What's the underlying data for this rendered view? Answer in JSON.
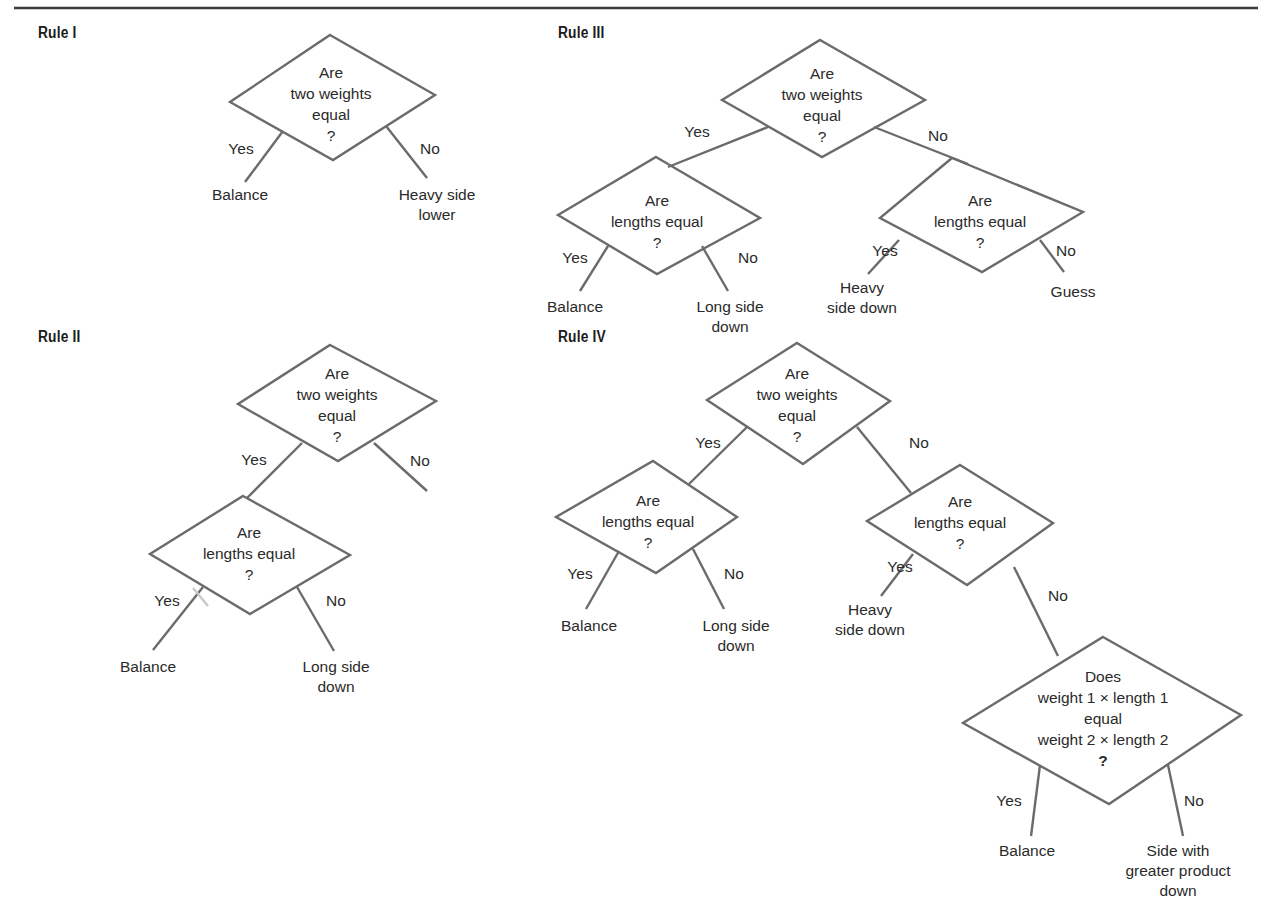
{
  "page": {
    "top_rule": {
      "x1": 14,
      "y1": 8,
      "x2": 1258,
      "y2": 8,
      "color": "#3a3a3a"
    }
  },
  "colors": {
    "line": "#6b6b6b",
    "text": "#2a2a2a",
    "title": "#1c1c1c"
  },
  "rules": [
    {
      "id": "rule-1",
      "title": "Rule I",
      "title_pos": {
        "x": 38,
        "y": 38
      },
      "decisions": [
        {
          "id": "r1-weights",
          "points": [
            [
              330,
              35
            ],
            [
              435,
              95
            ],
            [
              333,
              160
            ],
            [
              230,
              102
            ]
          ],
          "lines": [
            "Are",
            "two weights",
            "equal",
            "?"
          ],
          "text_x": 331,
          "text_y": 78,
          "line_h": 21
        }
      ],
      "edges": [
        {
          "from": "r1-weights",
          "x1": 283,
          "y1": 131,
          "x2": 245,
          "y2": 182,
          "label": "Yes",
          "lx": 241,
          "ly": 154
        },
        {
          "from": "r1-weights",
          "x1": 386,
          "y1": 126,
          "x2": 427,
          "y2": 178,
          "label": "No",
          "lx": 430,
          "ly": 154
        }
      ],
      "outcomes": [
        {
          "lines": [
            "Balance"
          ],
          "x": 240,
          "y": 200
        },
        {
          "lines": [
            "Heavy side",
            "lower"
          ],
          "x": 437,
          "y": 200
        }
      ]
    },
    {
      "id": "rule-3",
      "title": "Rule III",
      "title_pos": {
        "x": 558,
        "y": 38
      },
      "decisions": [
        {
          "id": "r3-weights",
          "points": [
            [
              820,
              40
            ],
            [
              925,
              100
            ],
            [
              822,
              157
            ],
            [
              722,
              100
            ]
          ],
          "lines": [
            "Are",
            "two weights",
            "equal",
            "?"
          ],
          "text_x": 822,
          "text_y": 79,
          "line_h": 21
        },
        {
          "id": "r3-lengths-left",
          "points": [
            [
              656,
              157
            ],
            [
              760,
              218
            ],
            [
              657,
              274
            ],
            [
              558,
              215
            ]
          ],
          "lines": [
            "Are",
            "lengths equal",
            "?"
          ],
          "text_x": 657,
          "text_y": 206,
          "line_h": 21
        },
        {
          "id": "r3-lengths-right",
          "points": [
            [
              952,
              158
            ],
            [
              1083,
              212
            ],
            [
              982,
              272
            ],
            [
              880,
              218
            ]
          ],
          "lines": [
            "Are",
            "lengths equal",
            "?"
          ],
          "text_x": 980,
          "text_y": 206,
          "line_h": 21
        }
      ],
      "edges": [
        {
          "from": "r3-weights",
          "x1": 768,
          "y1": 127,
          "x2": 668,
          "y2": 167,
          "label": "Yes",
          "lx": 697,
          "ly": 137
        },
        {
          "from": "r3-weights",
          "x1": 874,
          "y1": 127,
          "x2": 968,
          "y2": 164,
          "label": "No",
          "lx": 938,
          "ly": 141
        },
        {
          "from": "r3-lengths-left",
          "x1": 608,
          "y1": 246,
          "x2": 580,
          "y2": 291,
          "label": "Yes",
          "lx": 575,
          "ly": 263
        },
        {
          "from": "r3-lengths-left",
          "x1": 702,
          "y1": 246,
          "x2": 728,
          "y2": 291,
          "label": "No",
          "lx": 748,
          "ly": 263
        },
        {
          "from": "r3-lengths-right",
          "x1": 899,
          "y1": 240,
          "x2": 868,
          "y2": 274,
          "label": "Yes",
          "lx": 885,
          "ly": 256
        },
        {
          "from": "r3-lengths-right",
          "x1": 1040,
          "y1": 240,
          "x2": 1064,
          "y2": 272,
          "label": "No",
          "lx": 1066,
          "ly": 256
        }
      ],
      "outcomes": [
        {
          "lines": [
            "Balance"
          ],
          "x": 575,
          "y": 312
        },
        {
          "lines": [
            "Long side",
            "down"
          ],
          "x": 730,
          "y": 312
        },
        {
          "lines": [
            "Heavy",
            "side down"
          ],
          "x": 862,
          "y": 293
        },
        {
          "lines": [
            "Guess"
          ],
          "x": 1073,
          "y": 297
        }
      ]
    },
    {
      "id": "rule-2",
      "title": "Rule II",
      "title_pos": {
        "x": 38,
        "y": 342
      },
      "decisions": [
        {
          "id": "r2-weights",
          "points": [
            [
              330,
              345
            ],
            [
              436,
              401
            ],
            [
              338,
              461
            ],
            [
              238,
              404
            ]
          ],
          "lines": [
            "Are",
            "two weights",
            "equal",
            "?"
          ],
          "text_x": 337,
          "text_y": 379,
          "line_h": 21
        },
        {
          "id": "r2-lengths",
          "points": [
            [
              243,
              496
            ],
            [
              350,
              555
            ],
            [
              250,
              614
            ],
            [
              150,
              554
            ]
          ],
          "lines": [
            "Are",
            "lengths equal",
            "?"
          ],
          "text_x": 249,
          "text_y": 538,
          "line_h": 21
        }
      ],
      "edges": [
        {
          "from": "r2-weights",
          "x1": 302,
          "y1": 443,
          "x2": 247,
          "y2": 498,
          "label": "Yes",
          "lx": 254,
          "ly": 465
        },
        {
          "from": "r2-weights",
          "x1": 374,
          "y1": 443,
          "x2": 427,
          "y2": 491,
          "label": "No",
          "lx": 420,
          "ly": 466
        },
        {
          "from": "r2-lengths",
          "x1": 203,
          "y1": 587,
          "x2": 153,
          "y2": 650,
          "label": "Yes",
          "lx": 167,
          "ly": 606
        },
        {
          "from": "r2-lengths",
          "x1": 297,
          "y1": 587,
          "x2": 334,
          "y2": 651,
          "label": "No",
          "lx": 336,
          "ly": 606
        },
        {
          "from": "r2-lengths",
          "x1": 193,
          "y1": 588,
          "x2": 208,
          "y2": 606,
          "label": "",
          "lx": 0,
          "ly": 0,
          "faint": true
        }
      ],
      "outcomes": [
        {
          "lines": [
            "Balance"
          ],
          "x": 148,
          "y": 672
        },
        {
          "lines": [
            "Long side",
            "down"
          ],
          "x": 336,
          "y": 672
        }
      ]
    },
    {
      "id": "rule-4",
      "title": "Rule IV",
      "title_pos": {
        "x": 558,
        "y": 342
      },
      "decisions": [
        {
          "id": "r4-weights",
          "points": [
            [
              797,
              343
            ],
            [
              890,
              401
            ],
            [
              803,
              464
            ],
            [
              707,
              400
            ]
          ],
          "lines": [
            "Are",
            "two weights",
            "equal",
            "?"
          ],
          "text_x": 797,
          "text_y": 379,
          "line_h": 21
        },
        {
          "id": "r4-lengths-left",
          "points": [
            [
              653,
              461
            ],
            [
              737,
              517
            ],
            [
              656,
              573
            ],
            [
              556,
              517
            ]
          ],
          "lines": [
            "Are",
            "lengths equal",
            "?"
          ],
          "text_x": 648,
          "text_y": 506,
          "line_h": 21
        },
        {
          "id": "r4-lengths-right",
          "points": [
            [
              960,
              465
            ],
            [
              1053,
              523
            ],
            [
              967,
              585
            ],
            [
              867,
              521
            ]
          ],
          "lines": [
            "Are",
            "lengths equal",
            "?"
          ],
          "text_x": 960,
          "text_y": 507,
          "line_h": 21
        },
        {
          "id": "r4-product",
          "points": [
            [
              1103,
              637
            ],
            [
              1241,
              715
            ],
            [
              1109,
              804
            ],
            [
              963,
              723
            ]
          ],
          "lines": [
            "Does",
            "weight 1 × length 1",
            "equal",
            "weight 2 × length 2",
            "?"
          ],
          "text_x": 1103,
          "text_y": 682,
          "line_h": 21
        }
      ],
      "edges": [
        {
          "from": "r4-weights",
          "x1": 747,
          "y1": 427,
          "x2": 689,
          "y2": 484,
          "label": "Yes",
          "lx": 708,
          "ly": 448
        },
        {
          "from": "r4-weights",
          "x1": 857,
          "y1": 427,
          "x2": 911,
          "y2": 493,
          "label": "No",
          "lx": 919,
          "ly": 448
        },
        {
          "from": "r4-lengths-left",
          "x1": 619,
          "y1": 551,
          "x2": 586,
          "y2": 609,
          "label": "Yes",
          "lx": 580,
          "ly": 579
        },
        {
          "from": "r4-lengths-left",
          "x1": 693,
          "y1": 549,
          "x2": 724,
          "y2": 609,
          "label": "No",
          "lx": 734,
          "ly": 579
        },
        {
          "from": "r4-lengths-right",
          "x1": 913,
          "y1": 554,
          "x2": 881,
          "y2": 596,
          "label": "Yes",
          "lx": 900,
          "ly": 572
        },
        {
          "from": "r4-lengths-right",
          "x1": 1014,
          "y1": 567,
          "x2": 1058,
          "y2": 656,
          "label": "No",
          "lx": 1058,
          "ly": 601
        },
        {
          "from": "r4-product",
          "x1": 1040,
          "y1": 765,
          "x2": 1031,
          "y2": 836,
          "label": "Yes",
          "lx": 1009,
          "ly": 806
        },
        {
          "from": "r4-product",
          "x1": 1168,
          "y1": 765,
          "x2": 1183,
          "y2": 836,
          "label": "No",
          "lx": 1194,
          "ly": 806
        }
      ],
      "outcomes": [
        {
          "lines": [
            "Balance"
          ],
          "x": 589,
          "y": 631
        },
        {
          "lines": [
            "Long side",
            "down"
          ],
          "x": 736,
          "y": 631
        },
        {
          "lines": [
            "Heavy",
            "side down"
          ],
          "x": 870,
          "y": 615
        },
        {
          "lines": [
            "Balance"
          ],
          "x": 1027,
          "y": 856
        },
        {
          "lines": [
            "Side with",
            "greater product",
            "down"
          ],
          "x": 1178,
          "y": 856
        }
      ]
    }
  ]
}
